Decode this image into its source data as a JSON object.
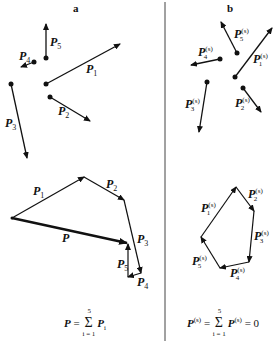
{
  "figure": {
    "panels": [
      {
        "id": "a",
        "letter": "a",
        "forces": [
          {
            "name": "P1",
            "label": "P",
            "sub": "1",
            "base": [
              46,
              84
            ],
            "tip": [
              120,
              44
            ]
          },
          {
            "name": "P2",
            "label": "P",
            "sub": "2",
            "base": [
              50,
              97
            ],
            "tip": [
              90,
              121
            ]
          },
          {
            "name": "P3",
            "label": "P",
            "sub": "3",
            "base": [
              11,
              84
            ],
            "tip": [
              27,
              158
            ]
          },
          {
            "name": "P4",
            "label": "P",
            "sub": "4",
            "base": [
              34,
              62
            ],
            "tip": [
              22,
              67
            ]
          },
          {
            "name": "P5",
            "label": "P",
            "sub": "5",
            "base": [
              46,
              58
            ],
            "tip": [
              46,
              25
            ]
          }
        ],
        "polygon": {
          "resultant_label": "P",
          "vertices": [
            [
              12,
              218
            ],
            [
              84,
              177
            ],
            [
              124,
              200
            ],
            [
              141,
              273
            ],
            [
              128,
              277
            ],
            [
              128,
              243
            ]
          ],
          "edge_labels": [
            "P1",
            "P2",
            "P3",
            "P4",
            "P5"
          ]
        },
        "formula": {
          "lhs": "P",
          "eq": "=",
          "sum_upper": "5",
          "sum_lower": "i = 1",
          "term": "P",
          "term_sub": "i"
        }
      },
      {
        "id": "b",
        "letter": "b",
        "forces": [
          {
            "name": "P1(s)",
            "label": "P",
            "sub": "1",
            "sup": "(s)",
            "base": [
              235,
              77
            ],
            "tip": [
              272,
              28
            ]
          },
          {
            "name": "P2(s)",
            "label": "P",
            "sub": "2",
            "sup": "(s)",
            "base": [
              243,
              88
            ],
            "tip": [
              261,
              112
            ]
          },
          {
            "name": "P3(s)",
            "label": "P",
            "sub": "3",
            "sup": "(s)",
            "base": [
              207,
              82
            ],
            "tip": [
              199,
              132
            ]
          },
          {
            "name": "P4(s)",
            "label": "P",
            "sub": "4",
            "sup": "(s)",
            "base": [
              220,
              59
            ],
            "tip": [
              191,
              65
            ]
          },
          {
            "name": "P5(s)",
            "label": "P",
            "sub": "5",
            "sup": "(s)",
            "base": [
              237,
              53
            ],
            "tip": [
              221,
              22
            ]
          }
        ],
        "polygon": {
          "vertices": [
            [
              201,
              237
            ],
            [
              236,
              187
            ],
            [
              254,
              211
            ],
            [
              249,
              262
            ],
            [
              220,
              268
            ]
          ],
          "closed": true
        },
        "formula": {
          "lhs": "P",
          "lhs_sup": "(s)",
          "eq": "=",
          "sum_upper": "5",
          "sum_lower": "i = 1",
          "term": "P",
          "term_sub": "i",
          "term_sup": "(s)",
          "rhs": "= 0"
        }
      }
    ],
    "colors": {
      "ink": "#111111",
      "background": "#ffffff",
      "divider": "#444444"
    }
  }
}
